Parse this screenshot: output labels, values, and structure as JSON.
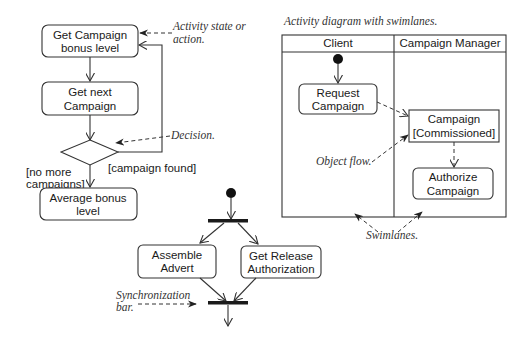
{
  "figure": {
    "left_flow": {
      "nodes": [
        {
          "id": "get-campaign-bonus",
          "lines": [
            "Get Campaign",
            "bonus level"
          ]
        },
        {
          "id": "get-next-campaign",
          "lines": [
            "Get next",
            "Campaign"
          ]
        },
        {
          "id": "average-bonus",
          "lines": [
            "Average bonus",
            "level"
          ]
        }
      ],
      "guards": {
        "no_more": [
          "[no more",
          "campaigns]"
        ],
        "found": "[campaign found]"
      },
      "annotations": {
        "activity": [
          "Activity state or",
          "action."
        ],
        "decision": "Decision."
      }
    },
    "swimlane": {
      "caption": "Activity diagram with swimlanes.",
      "lanes": [
        "Client",
        "Campaign Manager"
      ],
      "nodes": {
        "request": [
          "Request",
          "Campaign"
        ],
        "object": [
          "Campaign",
          "[Commissioned]"
        ],
        "authorize": [
          "Authorize",
          "Campaign"
        ]
      },
      "annotations": {
        "object_flow": "Object flow.",
        "swimlanes": "Swimlanes."
      }
    },
    "fork_join": {
      "nodes": {
        "assemble": [
          "Assemble",
          "Advert"
        ],
        "release": [
          "Get Release",
          "Authorization"
        ]
      },
      "annotations": {
        "sync": [
          "Synchronization",
          "bar."
        ]
      }
    }
  }
}
